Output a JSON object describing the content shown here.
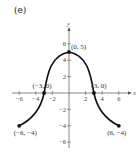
{
  "panel_label": "(e)",
  "chart_data": {
    "type": "line",
    "title": "(e)",
    "xlabel": "x",
    "ylabel": "y",
    "xlim": [
      -7,
      7
    ],
    "ylim": [
      -7,
      7
    ],
    "grid": false,
    "x_ticks": [
      -6,
      -4,
      -2,
      2,
      4,
      6
    ],
    "y_ticks": [
      6,
      4,
      2,
      -2,
      -4,
      -6
    ],
    "x_tick_labels": [
      "−6",
      "−4",
      "−2",
      "2",
      "4",
      "6"
    ],
    "y_tick_labels": [
      "6",
      "4",
      "2",
      "−2",
      "−4",
      "−6"
    ],
    "series": [
      {
        "name": "f(x)",
        "x": [
          -6,
          -4,
          -3,
          -2,
          -1,
          0,
          1,
          2,
          3,
          4,
          6
        ],
        "y": [
          -4,
          -2,
          0,
          4,
          4.9,
          5,
          4.9,
          4,
          0,
          -2,
          -4
        ]
      }
    ],
    "points": [
      {
        "x": 0,
        "y": 5,
        "label": "(0, 5)"
      },
      {
        "x": -3,
        "y": 0,
        "label": "(−3, 0)"
      },
      {
        "x": 3,
        "y": 0,
        "label": "(3, 0)"
      },
      {
        "x": -6,
        "y": -4,
        "label": "(−6, −4)"
      },
      {
        "x": 6,
        "y": -4,
        "label": "(6, −4)"
      }
    ]
  }
}
